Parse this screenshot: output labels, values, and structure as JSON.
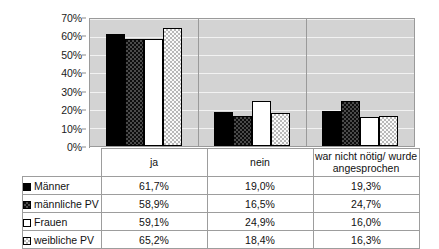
{
  "chart_data": {
    "type": "bar",
    "title": "",
    "xlabel": "",
    "ylabel": "",
    "ylim": [
      0,
      70
    ],
    "grid": true,
    "legend_position": "table-below",
    "categories": [
      "ja",
      "nein",
      "war nicht nötig/ wurde angesprochen"
    ],
    "ytick_labels": [
      "0%",
      "10%",
      "20%",
      "30%",
      "40%",
      "50%",
      "60%",
      "70%"
    ],
    "ytick_values": [
      0,
      10,
      20,
      30,
      40,
      50,
      60,
      70
    ],
    "series": [
      {
        "name": "Männer",
        "pattern": "solid-black",
        "values": [
          61.7,
          19.0,
          19.3
        ],
        "labels": [
          "61,7%",
          "19,0%",
          "19,3%"
        ]
      },
      {
        "name": "männliche PV",
        "pattern": "dark-checker",
        "values": [
          58.9,
          16.5,
          24.7
        ],
        "labels": [
          "58,9%",
          "16,5%",
          "24,7%"
        ]
      },
      {
        "name": "Frauen",
        "pattern": "white-outline",
        "values": [
          59.1,
          24.9,
          16.0
        ],
        "labels": [
          "59,1%",
          "24,9%",
          "16,0%"
        ]
      },
      {
        "name": "weibliche PV",
        "pattern": "light-dotted",
        "values": [
          65.2,
          18.4,
          16.3
        ],
        "labels": [
          "65,2%",
          "18,4%",
          "16,3%"
        ]
      }
    ]
  },
  "colors": {
    "plot_background": "#d3d3d3",
    "gridline": "#f2f2f2",
    "axis": "#8f8f8f",
    "series_solid": "#000000",
    "series_white": "#ffffff",
    "table_border": "#9d9d9d"
  }
}
